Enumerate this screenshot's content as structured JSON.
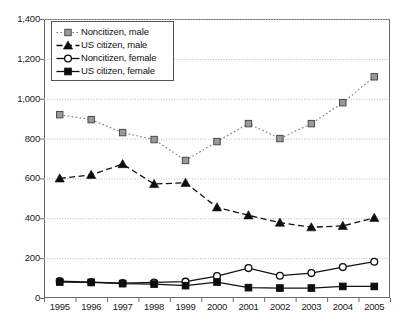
{
  "chart_data": {
    "type": "line",
    "title": "",
    "subtitle": "",
    "xlabel": "",
    "ylabel": "",
    "categories": [
      "1995",
      "1996",
      "1997",
      "1998",
      "1999",
      "2000",
      "2001",
      "2002",
      "2003",
      "2004",
      "2005"
    ],
    "x": [
      1995,
      1996,
      1997,
      1998,
      1999,
      2000,
      2001,
      2002,
      2003,
      2004,
      2005
    ],
    "ylim": [
      0,
      1400
    ],
    "yticks": [
      0,
      200,
      400,
      600,
      800,
      1000,
      1200,
      1400
    ],
    "ytick_labels": [
      "0",
      "200",
      "400",
      "600",
      "800",
      "1,000",
      "1,200",
      "1,400"
    ],
    "grid": true,
    "grid_axis": "y",
    "legend_position": "upper-left-inside",
    "series": [
      {
        "name": "Noncitizen, male",
        "marker": "square-gray",
        "line_style": "dotted",
        "color": "#808080",
        "values": [
          920,
          895,
          830,
          795,
          690,
          785,
          875,
          800,
          875,
          980,
          1110
        ]
      },
      {
        "name": "US citizen, male",
        "marker": "triangle-filled",
        "line_style": "dashed",
        "color": "#111111",
        "values": [
          600,
          618,
          672,
          572,
          578,
          455,
          415,
          378,
          355,
          362,
          402
        ]
      },
      {
        "name": "Noncitizen, female",
        "marker": "circle-open",
        "line_style": "solid",
        "color": "#111111",
        "values": [
          85,
          80,
          75,
          78,
          82,
          110,
          150,
          112,
          125,
          155,
          182
        ]
      },
      {
        "name": "US citizen, female",
        "marker": "square-filled",
        "line_style": "solid",
        "color": "#111111",
        "values": [
          80,
          78,
          72,
          70,
          62,
          80,
          52,
          50,
          50,
          58,
          58
        ]
      }
    ]
  },
  "legend": {
    "items": [
      {
        "label": "Noncitizen, male"
      },
      {
        "label": "US citizen, male"
      },
      {
        "label": "Noncitizen, female"
      },
      {
        "label": "US citizen, female"
      }
    ]
  },
  "axes": {
    "y_labels": [
      "1,400",
      "1,200",
      "1,000",
      "800",
      "600",
      "400",
      "200",
      "0"
    ],
    "x_labels": [
      "1995",
      "1996",
      "1997",
      "1998",
      "1999",
      "2000",
      "2001",
      "2002",
      "2003",
      "2004",
      "2005"
    ]
  }
}
